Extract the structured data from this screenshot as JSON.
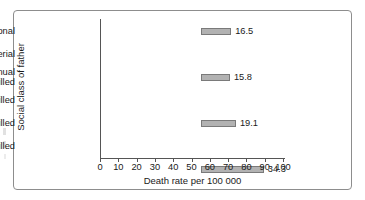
{
  "chart_data": {
    "type": "bar",
    "orientation": "horizontal",
    "title": "",
    "xlabel": "Death rate per 100 000",
    "ylabel": "Social class of father",
    "categories": [
      "Professional",
      "Managerial",
      "Non-manual\nskilled",
      "Manual skilled",
      "Partly skilled",
      "Unskilled"
    ],
    "values": [
      16.5,
      15.8,
      19.1,
      34.3,
      37.8,
      82.9
    ],
    "value_labels": [
      "16.5",
      "15.8",
      "19.1",
      "34.3",
      "37.8",
      "82.9"
    ],
    "xlim": [
      0,
      100
    ],
    "xticks": [
      0,
      10,
      20,
      30,
      40,
      50,
      60,
      70,
      80,
      90,
      100
    ],
    "xtick_labels": [
      "0",
      "10",
      "20",
      "30",
      "40",
      "50",
      "60",
      "70",
      "80",
      "90",
      "100"
    ],
    "grid": false,
    "legend": null,
    "bar_fill_color": "#b2b2b2",
    "bar_edge_color": "#7a7a7a",
    "axis_color": "#555555",
    "text_color": "#1a1a1a",
    "frame_color": "#8d8d8d",
    "background_color": "#ffffff"
  }
}
